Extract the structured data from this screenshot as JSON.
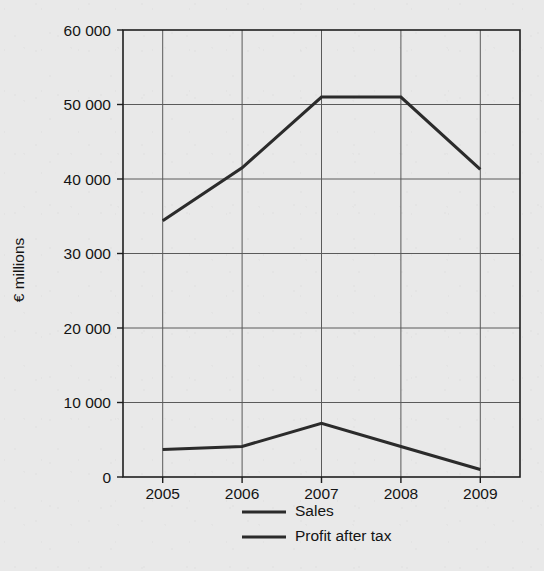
{
  "chart_data": {
    "type": "line",
    "title": "",
    "xlabel": "",
    "ylabel": "€ millions",
    "categories": [
      "2005",
      "2006",
      "2007",
      "2008",
      "2009"
    ],
    "series": [
      {
        "name": "Sales",
        "values": [
          34400,
          41500,
          51000,
          51000,
          41300
        ]
      },
      {
        "name": "Profit after tax",
        "values": [
          3700,
          4100,
          7200,
          4100,
          1000
        ]
      }
    ],
    "ylim": [
      0,
      60000
    ],
    "y_ticks": [
      0,
      10000,
      20000,
      30000,
      40000,
      50000,
      60000
    ],
    "y_tick_labels": [
      "0",
      "10 000",
      "20 000",
      "30 000",
      "40 000",
      "50 000",
      "60 000"
    ],
    "x_tick_labels": [
      "2005",
      "2006",
      "2007",
      "2008",
      "2009"
    ],
    "grid": true,
    "legend_position": "bottom",
    "legend_entries": [
      "Sales",
      "Profit after tax"
    ],
    "line_color": "#2b2b2b",
    "grid_color": "#5a5a5a",
    "frame_color": "#1e1e1e",
    "background_color": "#e9e9e9"
  }
}
